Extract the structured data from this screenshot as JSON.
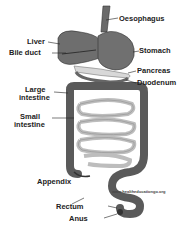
{
  "diagram": {
    "type": "anatomy",
    "labels": {
      "oesophagus": "Oesophagus",
      "liver": "Liver",
      "bile_duct": "Bile duct",
      "stomach": "Stomach",
      "pancreas": "Pancreas",
      "duodenum": "Duodenum",
      "large_intestine_1": "Large",
      "large_intestine_2": "intestine",
      "small_intestine_1": "Small",
      "small_intestine_2": "intestine",
      "appendix": "Appendix",
      "rectum": "Rectum",
      "anus": "Anus"
    },
    "watermark": "www.healtheducationgo.org",
    "colors": {
      "organ_dark": "#5a5a5a",
      "organ_mid": "#7a7a7a",
      "small_intestine": "#c8c8c8",
      "outline": "#333333",
      "background": "#ffffff"
    }
  }
}
